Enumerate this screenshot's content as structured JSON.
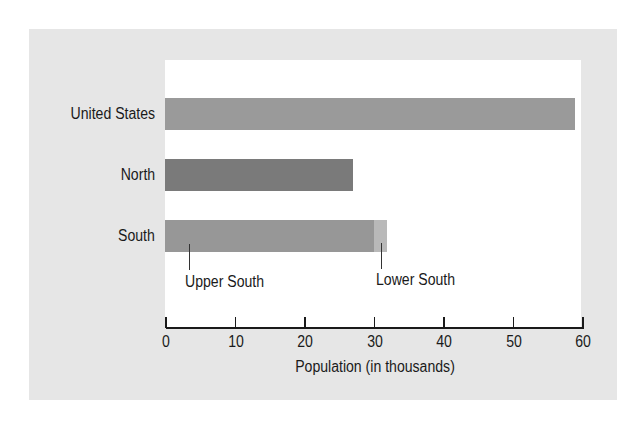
{
  "chart_data": {
    "type": "bar",
    "orientation": "horizontal",
    "title": "",
    "xlabel": "Population (in thousands)",
    "ylabel": "",
    "xlim": [
      0,
      60
    ],
    "xticks": [
      0,
      10,
      20,
      30,
      40,
      50,
      60
    ],
    "grid": false,
    "categories": [
      "United States",
      "North",
      "South"
    ],
    "values": [
      59,
      27,
      32
    ],
    "stacked_breakdown": {
      "South": [
        {
          "name": "Upper South",
          "value": 30
        },
        {
          "name": "Lower South",
          "value": 2
        }
      ]
    },
    "annotations": [
      "Upper South",
      "Lower South"
    ]
  },
  "colors": {
    "panel": "#e6e6e6",
    "plot": "#ffffff",
    "united_states": "#9a9a9a",
    "north": "#7a7a7a",
    "upper_south": "#979797",
    "lower_south": "#b9b9b9"
  },
  "labels": {
    "united_states": "United States",
    "north": "North",
    "south": "South",
    "upper_south": "Upper South",
    "lower_south": "Lower South",
    "axis_title": "Population (in thousands)",
    "ticks": [
      "0",
      "10",
      "20",
      "30",
      "40",
      "50",
      "60"
    ]
  }
}
